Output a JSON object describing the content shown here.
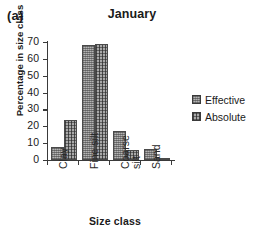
{
  "panel": {
    "label": "(a)"
  },
  "chart_data": {
    "type": "bar",
    "title": "January",
    "xlabel": "Size class",
    "ylabel": "Percentage in size class",
    "categories": [
      "Clay",
      "Fine silt",
      "Coarse silt",
      "Sand"
    ],
    "category_lines": [
      [
        "Clay"
      ],
      [
        "Fine silt"
      ],
      [
        "Coarse",
        "silt"
      ],
      [
        "Sand"
      ]
    ],
    "series": [
      {
        "name": "Effective",
        "values": [
          7.5,
          68.2,
          17.2,
          6.4
        ],
        "pattern": "checkerboard",
        "color": "#b4b4b4"
      },
      {
        "name": "Absolute",
        "values": [
          23.5,
          68.8,
          6.0,
          1.0
        ],
        "pattern": "crosshatch",
        "color": "#a9a9a9"
      }
    ],
    "ylim": [
      0,
      70
    ],
    "yticks": [
      0,
      10,
      20,
      30,
      40,
      50,
      60,
      70
    ],
    "ytick_labels": [
      "0",
      "10",
      "20",
      "30",
      "40",
      "50",
      "60",
      "70"
    ],
    "grid": false,
    "legend_position": "right"
  }
}
